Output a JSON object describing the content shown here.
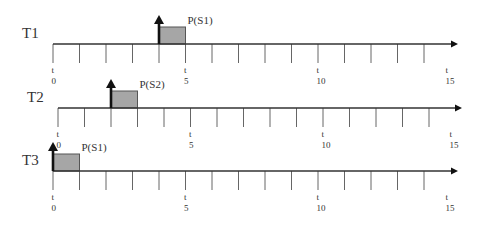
{
  "diagram": {
    "type": "timeline-schedule",
    "colors": {
      "axis": "#333333",
      "tick": "#666666",
      "block_fill": "#a6a6a6",
      "block_stroke": "#555555",
      "arrow": "#111111"
    },
    "tick_count": 15,
    "tick_label_prefix": "t",
    "tick_labels": [
      {
        "t": 0,
        "time": "t",
        "value": "0"
      },
      {
        "t": 5,
        "time": "t",
        "value": "5"
      },
      {
        "t": 10,
        "time": "t",
        "value": "10"
      },
      {
        "t": 15,
        "time": "t",
        "value": "15"
      }
    ],
    "tasks": [
      {
        "name": "T1",
        "label": "T1",
        "arrival": 4,
        "block_start": 4,
        "block_end": 5,
        "block_label": "P(S1)",
        "axis_y": 44,
        "x0": 53,
        "x_end": 458,
        "step": 26.5
      },
      {
        "name": "T2",
        "label": "T2",
        "arrival": 2,
        "block_start": 2,
        "block_end": 3,
        "block_label": "P(S2)",
        "axis_y": 108,
        "x0": 58,
        "x_end": 462,
        "step": 26.5
      },
      {
        "name": "T3",
        "label": "T3",
        "arrival": 0,
        "block_start": 0,
        "block_end": 1,
        "block_label": "P(S1)",
        "axis_y": 171,
        "x0": 53,
        "x_end": 458,
        "step": 26.5
      }
    ]
  }
}
